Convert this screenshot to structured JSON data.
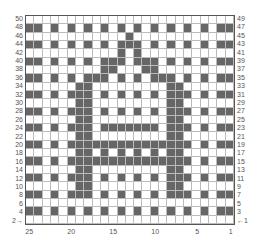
{
  "chart_data": {
    "type": "heatmap",
    "title": "",
    "columns": 25,
    "rows": 50,
    "colors": {
      "dark": "#666666",
      "light": "#ffffff",
      "grid": "#bbbbbb"
    },
    "left_row_labels": [
      "50",
      "48",
      "46",
      "44",
      "42",
      "40",
      "38",
      "36",
      "34",
      "32",
      "30",
      "28",
      "26",
      "24",
      "22",
      "20",
      "18",
      "16",
      "14",
      "12",
      "10",
      "8",
      "6",
      "4",
      "2→"
    ],
    "right_row_labels": [
      "49",
      "47",
      "45",
      "43",
      "41",
      "39",
      "37",
      "35",
      "33",
      "31",
      "29",
      "27",
      "25",
      "23",
      "21",
      "19",
      "17",
      "15",
      "13",
      "11",
      "9",
      "7",
      "5",
      "3",
      "←1"
    ],
    "bottom_col_labels": [
      {
        "label": "25",
        "col": 1
      },
      {
        "label": "20",
        "col": 6
      },
      {
        "label": "15",
        "col": 11
      },
      {
        "label": "10",
        "col": 16
      },
      {
        "label": "5",
        "col": 21
      },
      {
        "label": "1",
        "col": 25
      }
    ],
    "grid": [
      "0000000000000000000000000",
      "1101010101010101010101011",
      "0000000000001000000000000",
      "1101010101011101010101011",
      "0000000000010100000000000",
      "1101010101110111010101011",
      "0000000001100011000000000",
      "1101010111010101110101011",
      "0000001100000000011000000",
      "1101011101010101011101011",
      "0000001100000000011000000",
      "1101011101010101011101011",
      "0000001100000000011000000",
      "1101011101111111011101011",
      "0000001100000000011000000",
      "1101011111111111111101011",
      "0000001101010101011000000",
      "1101011111111111111101011",
      "0000001100000000011000000",
      "1101011101010101011101011",
      "0000001100000000011000000",
      "1101011101010101011101011",
      "0000000000000000000000000",
      "1101010101010101010101011",
      "0000000000000000000000000"
    ]
  }
}
